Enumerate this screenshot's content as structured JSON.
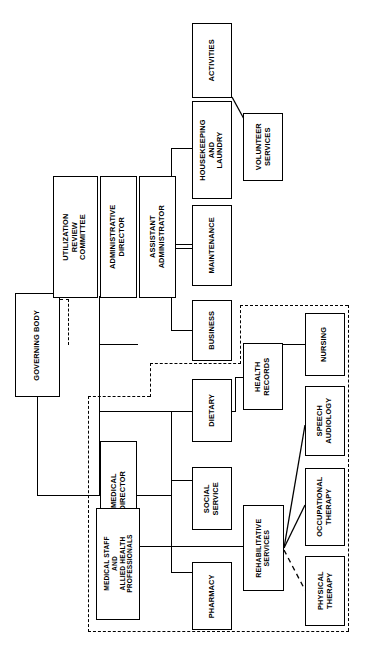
{
  "chart": {
    "orientation": "rotated-90-counterclockwise",
    "line_color": "#000000",
    "box_fill": "#ffffff",
    "nodes": {
      "governing_body": "GOVERNING BODY",
      "utilization_review_committee": "UTILIZATION\nREVIEW\nCOMMITTEE",
      "administrative_director": "ADMINISTRATIVE\nDIRECTOR",
      "assistant_administrator": "ASSISTANT\nADMINISTRATOR",
      "activities": "ACTIVITIES",
      "housekeeping_and_laundry": "HOUSEKEEPING\nAND\nLAUNDRY",
      "volunteer_services": "VOLUNTEER\nSERVICES",
      "maintenance": "MAINTENANCE",
      "business": "BUSINESS",
      "health_records": "HEALTH\nRECORDS",
      "nursing": "NURSING",
      "dietary": "DIETARY",
      "social_service": "SOCIAL\nSERVICE",
      "pharmacy": "PHARMACY",
      "medical_director": "MEDICAL\nDIRECTOR",
      "medical_staff_allied": "MEDICAL STAFF\nAND\nALLIED HEALTH\nPROFESSIONALS",
      "rehabilitative_services": "REHABILITATIVE\nSERVICES",
      "speech_audiology": "SPEECH\nAUDIOLOGY",
      "occupational_therapy": "OCCUPATIONAL\nTHERAPY",
      "physical_therapy": "PHYSICAL\nTHERAPY"
    }
  }
}
